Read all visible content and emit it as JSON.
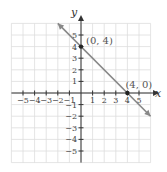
{
  "chart_data": {
    "type": "line",
    "title": "",
    "xlabel": "x",
    "ylabel": "y",
    "xlim": [
      -6,
      6
    ],
    "ylim": [
      -6,
      6
    ],
    "grid": true,
    "x_ticks": [
      -5,
      -4,
      -3,
      -2,
      -1,
      1,
      2,
      3,
      4,
      5
    ],
    "y_ticks": [
      -5,
      -4,
      -3,
      -2,
      -1,
      1,
      2,
      3,
      4,
      5
    ],
    "x_tick_labels": [
      "−5",
      "−4",
      "−3",
      "−2",
      "−1",
      "1",
      "2",
      "3",
      "4",
      "5"
    ],
    "y_tick_labels": [
      "−5",
      "−4",
      "−3",
      "−2",
      "−1",
      "1",
      "2",
      "3",
      "4",
      "5"
    ],
    "series": [
      {
        "name": "y = -x + 4",
        "x": [
          -2,
          6
        ],
        "y": [
          6,
          -2
        ],
        "arrows": "both",
        "color": "#888888"
      }
    ],
    "points": [
      {
        "x": 0,
        "y": 4,
        "label": "(0, 4)"
      },
      {
        "x": 4,
        "y": 0,
        "label": "(4, 0)"
      }
    ],
    "colors": {
      "axis": "#333333",
      "grid": "#dddddd",
      "line": "#888888",
      "point": "#222222"
    }
  }
}
